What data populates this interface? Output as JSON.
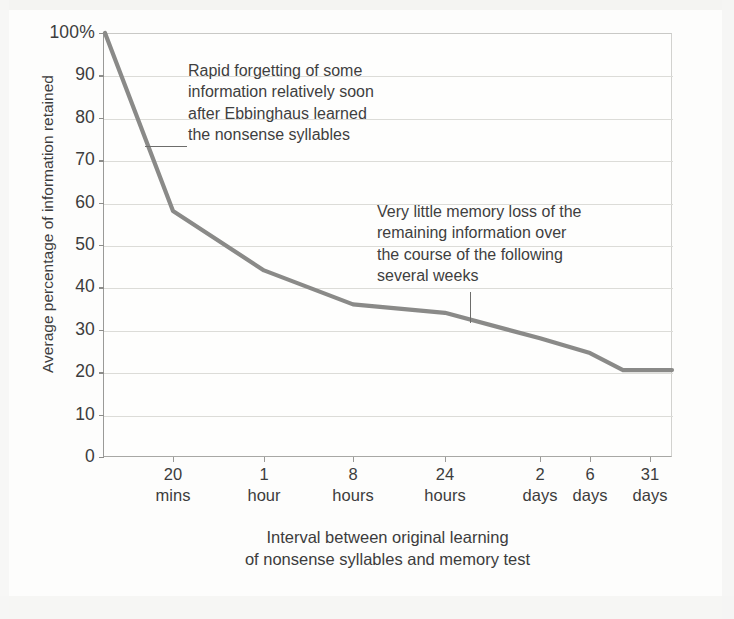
{
  "chart_data": {
    "type": "line",
    "title": "",
    "subtitle": "",
    "xlabel": "Interval between original learning\nof nonsense syllables and memory test",
    "ylabel": "Average percentage of information retained",
    "ylim": [
      0,
      100
    ],
    "grid": true,
    "legend_position": "none",
    "categories": [
      "20 mins",
      "1 hour",
      "8 hours",
      "24 hours",
      "2 days",
      "6 days",
      "31 days"
    ],
    "x_tick_labels_line1": [
      "20",
      "1",
      "8",
      "24",
      "2",
      "6",
      "31"
    ],
    "x_tick_labels_line2": [
      "mins",
      "hour",
      "hours",
      "hours",
      "days",
      "days",
      "days"
    ],
    "y_tick_labels": [
      "100%",
      "90",
      "80",
      "70",
      "60",
      "50",
      "40",
      "30",
      "20",
      "10",
      "0"
    ],
    "y_tick_values": [
      100,
      90,
      80,
      70,
      60,
      50,
      40,
      30,
      20,
      10,
      0
    ],
    "series": [
      {
        "name": "Average percentage of information retained",
        "color": "#8a8a88",
        "x": [
          "0 mins",
          "20 mins",
          "1 hour",
          "8 hours",
          "24 hours",
          "2 days",
          "6 days",
          "20 days",
          "31 days"
        ],
        "values": [
          100,
          58,
          44,
          36,
          34,
          28,
          24.5,
          20.5,
          20.5
        ]
      }
    ],
    "annotations": [
      {
        "id": "rapid-forgetting",
        "text": "Rapid forgetting of some\ninformation relatively soon\nafter Ebbinghaus learned\nthe nonsense syllables",
        "leader": "horizontal-line-to-curve"
      },
      {
        "id": "little-memory-loss",
        "text": "Very little memory loss of the\nremaining information over\nthe course of the following\nseveral weeks",
        "leader": "vertical-line-to-curve"
      }
    ],
    "colors": {
      "line": "#8a8a88",
      "grid": "#dcdcd8",
      "axis": "#9a9a98",
      "text": "#3c3c3c",
      "background": "#fdfdfc"
    }
  },
  "axis": {
    "y_title": "Average percentage of information retained",
    "x_title_line1": "Interval between original learning",
    "x_title_line2": "of nonsense syllables and memory test"
  },
  "annotations": {
    "first": "Rapid forgetting of some\ninformation relatively soon\nafter Ebbinghaus learned\nthe nonsense syllables",
    "second": "Very little memory loss of the\nremaining information over\nthe course of the following\nseveral weeks"
  }
}
